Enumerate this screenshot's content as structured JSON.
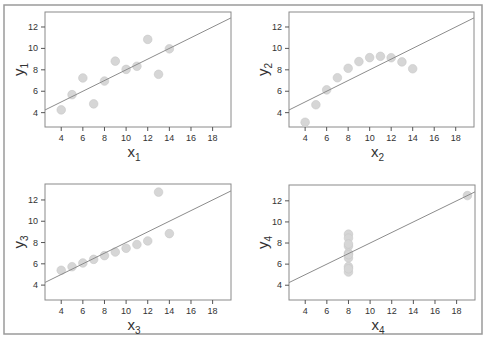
{
  "figure": {
    "point_color": "#d6d6d6",
    "line_color": "#8c8c8c",
    "frame_color": "#8a8a8a"
  },
  "chart_data": [
    {
      "type": "scatter",
      "title": "",
      "xlabel": "x",
      "xlabel_sub": "1",
      "ylabel": "y",
      "ylabel_sub": "1",
      "xticks": [
        4,
        6,
        8,
        10,
        12,
        14,
        16,
        18
      ],
      "yticks": [
        4,
        6,
        8,
        10,
        12
      ],
      "xlim": [
        2.5,
        19.7
      ],
      "ylim": [
        2.66,
        13.4
      ],
      "grid": false,
      "x": [
        10,
        8,
        13,
        9,
        11,
        14,
        6,
        4,
        12,
        7,
        5
      ],
      "y": [
        8.04,
        6.95,
        7.58,
        8.81,
        8.33,
        9.96,
        7.24,
        4.26,
        10.84,
        4.82,
        5.68
      ],
      "fit_line": {
        "intercept": 3.0,
        "slope": 0.5
      }
    },
    {
      "type": "scatter",
      "title": "",
      "xlabel": "x",
      "xlabel_sub": "2",
      "ylabel": "y",
      "ylabel_sub": "2",
      "xticks": [
        4,
        6,
        8,
        10,
        12,
        14,
        16,
        18
      ],
      "yticks": [
        4,
        6,
        8,
        10,
        12
      ],
      "xlim": [
        2.5,
        19.7
      ],
      "ylim": [
        2.66,
        13.4
      ],
      "grid": false,
      "x": [
        10,
        8,
        13,
        9,
        11,
        14,
        6,
        4,
        12,
        7,
        5
      ],
      "y": [
        9.14,
        8.14,
        8.74,
        8.77,
        9.26,
        8.1,
        6.13,
        3.1,
        9.13,
        7.26,
        4.74
      ],
      "fit_line": {
        "intercept": 3.0,
        "slope": 0.5
      }
    },
    {
      "type": "scatter",
      "title": "",
      "xlabel": "x",
      "xlabel_sub": "3",
      "ylabel": "y",
      "ylabel_sub": "3",
      "xticks": [
        4,
        6,
        8,
        10,
        12,
        14,
        16,
        18
      ],
      "yticks": [
        4,
        6,
        8,
        10,
        12
      ],
      "xlim": [
        2.5,
        19.7
      ],
      "ylim": [
        2.6,
        13.5
      ],
      "grid": false,
      "x": [
        10,
        8,
        13,
        9,
        11,
        14,
        6,
        4,
        12,
        7,
        5
      ],
      "y": [
        7.46,
        6.77,
        12.74,
        7.11,
        7.81,
        8.84,
        6.08,
        5.39,
        8.15,
        6.42,
        5.73
      ],
      "fit_line": {
        "intercept": 3.0,
        "slope": 0.5
      }
    },
    {
      "type": "scatter",
      "title": "",
      "xlabel": "x",
      "xlabel_sub": "4",
      "ylabel": "y",
      "ylabel_sub": "4",
      "xticks": [
        4,
        6,
        8,
        10,
        12,
        14,
        16,
        18
      ],
      "yticks": [
        4,
        6,
        8,
        10,
        12
      ],
      "xlim": [
        2.5,
        19.7
      ],
      "ylim": [
        2.6,
        13.5
      ],
      "grid": false,
      "x": [
        8,
        8,
        8,
        8,
        8,
        8,
        8,
        19,
        8,
        8,
        8
      ],
      "y": [
        6.58,
        5.76,
        7.71,
        8.84,
        8.47,
        7.04,
        5.25,
        12.5,
        5.56,
        7.91,
        6.89
      ],
      "fit_line": {
        "intercept": 3.0,
        "slope": 0.5
      }
    }
  ]
}
